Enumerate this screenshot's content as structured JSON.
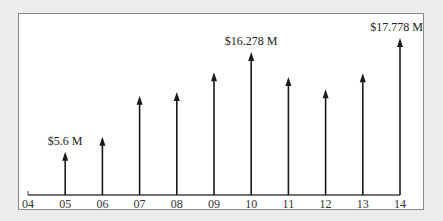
{
  "chart_data": {
    "type": "bar",
    "style": "arrow-stem",
    "title": "",
    "xlabel": "",
    "ylabel": "",
    "categories": [
      "04",
      "05",
      "06",
      "07",
      "08",
      "09",
      "10",
      "11",
      "12",
      "13",
      "14"
    ],
    "values": [
      null,
      5.6,
      7.2,
      11.6,
      12.0,
      14.1,
      16.278,
      13.6,
      12.3,
      14.0,
      17.778
    ],
    "unit": "$ M",
    "annotations": [
      {
        "category": "05",
        "text": "$5.6 M"
      },
      {
        "category": "10",
        "text": "$16.278 M"
      },
      {
        "category": "14",
        "text": "$17.778 M"
      }
    ],
    "grid": false,
    "legend": null,
    "ylim": [
      0,
      18
    ]
  },
  "colors": {
    "background": "#ececec",
    "plot_background": "#ffffff",
    "border": "#8a8a8a",
    "arrow": "#1a1a1a",
    "axis": "#444444"
  }
}
